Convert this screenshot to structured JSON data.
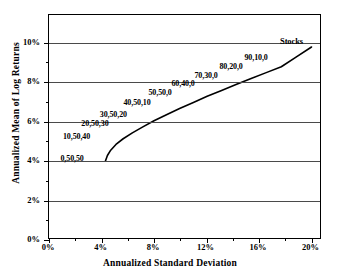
{
  "chart_data": {
    "type": "line",
    "title": "",
    "xlabel": "Annualized Standard Deviation",
    "ylabel": "Annualized Mean of Log Returns",
    "xlim": [
      0,
      20.8
    ],
    "ylim": [
      0,
      11.4
    ],
    "grid": true,
    "legend": null,
    "x_ticks": [
      {
        "value": 0,
        "label": "0%"
      },
      {
        "value": 2,
        "label": ""
      },
      {
        "value": 4,
        "label": "4%"
      },
      {
        "value": 6,
        "label": ""
      },
      {
        "value": 8,
        "label": "8%"
      },
      {
        "value": 10,
        "label": ""
      },
      {
        "value": 12,
        "label": "12%"
      },
      {
        "value": 14,
        "label": ""
      },
      {
        "value": 16,
        "label": "16%"
      },
      {
        "value": 18,
        "label": ""
      },
      {
        "value": 20,
        "label": "20%"
      }
    ],
    "y_ticks": [
      {
        "value": 0,
        "label": "0%"
      },
      {
        "value": 1,
        "label": ""
      },
      {
        "value": 2,
        "label": "2%"
      },
      {
        "value": 3,
        "label": ""
      },
      {
        "value": 4,
        "label": "4%"
      },
      {
        "value": 5,
        "label": ""
      },
      {
        "value": 6,
        "label": "6%"
      },
      {
        "value": 7,
        "label": ""
      },
      {
        "value": 8,
        "label": "8%"
      },
      {
        "value": 9,
        "label": ""
      },
      {
        "value": 10,
        "label": "10%"
      }
    ],
    "gridline_values": [
      2,
      4,
      6,
      8,
      10
    ],
    "series": [
      {
        "name": "Efficient frontier",
        "x": [
          4.3,
          4.45,
          4.7,
          5.1,
          5.65,
          6.35,
          7.15,
          8.0,
          8.95,
          9.95,
          11.0,
          12.05,
          13.15,
          14.25,
          15.4,
          16.55,
          17.7,
          18.85,
          20.0
        ],
        "y": [
          4.0,
          4.28,
          4.55,
          4.84,
          5.13,
          5.43,
          5.73,
          6.04,
          6.35,
          6.66,
          6.97,
          7.28,
          7.58,
          7.88,
          8.18,
          8.48,
          8.78,
          9.28,
          9.78
        ]
      }
    ],
    "annotations": [
      {
        "text": "0,50,50",
        "x": 4.3,
        "y": 4.0,
        "dx": -44,
        "dy": -5
      },
      {
        "text": "10,50,40",
        "x": 5.1,
        "y": 4.84,
        "dx": -52,
        "dy": -10
      },
      {
        "text": "20,50,30",
        "x": 6.35,
        "y": 5.43,
        "dx": -50,
        "dy": -12
      },
      {
        "text": "30,50,20",
        "x": 7.6,
        "y": 5.9,
        "dx": -48,
        "dy": -12
      },
      {
        "text": "40,50,10",
        "x": 9.1,
        "y": 6.42,
        "dx": -44,
        "dy": -13
      },
      {
        "text": "50,50,0",
        "x": 10.7,
        "y": 6.92,
        "dx": -40,
        "dy": -13
      },
      {
        "text": "60,40,0",
        "x": 12.3,
        "y": 7.38,
        "dx": -38,
        "dy": -13
      },
      {
        "text": "70,30,0",
        "x": 13.9,
        "y": 7.82,
        "dx": -36,
        "dy": -13
      },
      {
        "text": "80,20,0",
        "x": 15.5,
        "y": 8.22,
        "dx": -32,
        "dy": -14
      },
      {
        "text": "90,10,0",
        "x": 17.1,
        "y": 8.62,
        "dx": -28,
        "dy": -15
      },
      {
        "text": "Stocks",
        "x": 19.2,
        "y": 9.42,
        "dx": -20,
        "dy": -16
      }
    ]
  }
}
